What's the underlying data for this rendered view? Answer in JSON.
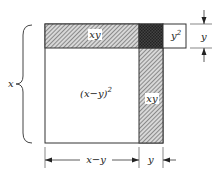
{
  "diagram": {
    "title": "",
    "labels": {
      "top_bar": "xy",
      "corner_box": "y",
      "corner_box_sup": "2",
      "main_square": "(x−y)",
      "main_square_sup": "2",
      "right_column": "xy",
      "left_brace": "x",
      "right_dim": "y",
      "bottom_dim_left": "x−y",
      "bottom_dim_right": "y"
    },
    "colors": {
      "stroke": "#333333",
      "hatch": "#555555",
      "overlap": "#3a3a3a",
      "label_bg": "#ffffff"
    }
  }
}
